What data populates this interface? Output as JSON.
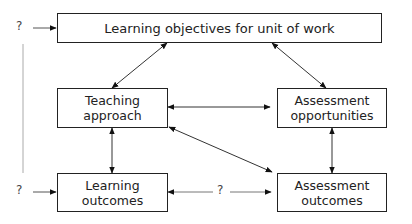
{
  "diagram": {
    "nodes": {
      "objectives": "Learning objectives for unit of work",
      "teaching_line1": "Teaching",
      "teaching_line2": "approach",
      "assess_opp_line1": "Assessment",
      "assess_opp_line2": "opportunities",
      "learning_out_line1": "Learning",
      "learning_out_line2": "outcomes",
      "assess_out_line1": "Assessment",
      "assess_out_line2": "outcomes"
    },
    "labels": {
      "q_top_left": "?",
      "q_bottom_left": "?",
      "q_middle": "?"
    },
    "edges": [
      {
        "from": "?",
        "to": "Learning objectives for unit of work",
        "type": "one-way"
      },
      {
        "from": "?",
        "to": "Learning outcomes",
        "type": "one-way"
      },
      {
        "from": "Learning objectives for unit of work",
        "to": "Teaching approach",
        "type": "two-way"
      },
      {
        "from": "Learning objectives for unit of work",
        "to": "Assessment opportunities",
        "type": "two-way"
      },
      {
        "from": "Teaching approach",
        "to": "Assessment opportunities",
        "type": "two-way"
      },
      {
        "from": "Teaching approach",
        "to": "Learning outcomes",
        "type": "two-way"
      },
      {
        "from": "Teaching approach",
        "to": "Assessment outcomes",
        "type": "two-way"
      },
      {
        "from": "Assessment opportunities",
        "to": "Assessment outcomes",
        "type": "two-way"
      },
      {
        "from": "Learning outcomes",
        "to": "Assessment outcomes",
        "type": "two-way",
        "label": "?"
      }
    ]
  }
}
